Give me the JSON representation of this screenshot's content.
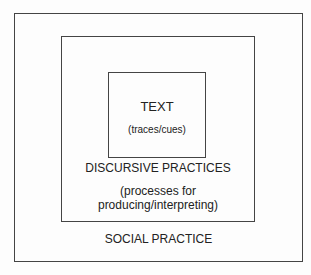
{
  "diagram": {
    "outer": {
      "label": "SOCIAL PRACTICE"
    },
    "middle": {
      "label": "DISCURSIVE PRACTICES",
      "sublabel_line1": "(processes for",
      "sublabel_line2": "producing/interpreting)"
    },
    "inner": {
      "label": "TEXT",
      "sublabel": "(traces/cues)"
    }
  }
}
